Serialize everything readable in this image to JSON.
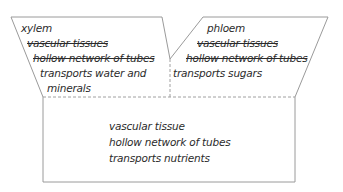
{
  "foldable": {
    "left_flap": {
      "title": "xylem",
      "crossed_out": [
        "vascular tissues",
        "hollow network of tubes"
      ],
      "lines": [
        "transports water and",
        "minerals"
      ]
    },
    "right_flap": {
      "title": "phloem",
      "crossed_out": [
        "vascular tissues",
        "hollow network of tubes"
      ],
      "lines": [
        "transports sugars"
      ]
    },
    "base": {
      "lines": [
        "vascular tissue",
        "hollow network of tubes",
        "transports nutrients"
      ]
    }
  },
  "colors": {
    "outline": "#9a9a9a",
    "dashed": "#a0a0a0",
    "text": "#2b2b2b"
  }
}
